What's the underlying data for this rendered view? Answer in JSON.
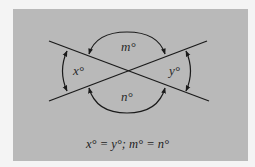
{
  "top_text": "",
  "diagram": {
    "labels": {
      "x": "x°",
      "y": "y°",
      "m": "m°",
      "n": "n°"
    },
    "caption": "x° = y°; m° = n°",
    "colors": {
      "panel_background": "#b9b9b9",
      "page_background": "#f4f4f4",
      "line": "#1a1a1a"
    },
    "lines": [
      {
        "from": [
          49,
          41
        ],
        "to": [
          209,
          101
        ]
      },
      {
        "from": [
          49,
          101
        ],
        "to": [
          207,
          41
        ]
      }
    ],
    "intersection": [
      127,
      71
    ]
  }
}
